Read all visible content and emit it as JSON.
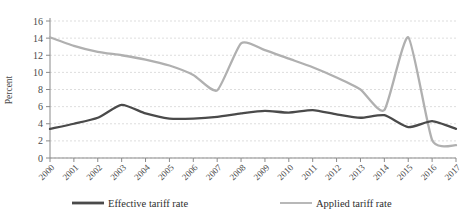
{
  "chart_data": {
    "type": "line",
    "title": "",
    "xlabel": "",
    "ylabel": "Percent",
    "ylim": [
      0,
      16
    ],
    "ytick_step": 2,
    "yticks": [
      "0",
      "2",
      "4",
      "6",
      "8",
      "10",
      "12",
      "14",
      "16"
    ],
    "grid": true,
    "legend_position": "bottom",
    "x": [
      "2000",
      "2001",
      "2002",
      "2003",
      "2004",
      "2005",
      "2006",
      "2007",
      "2008",
      "2009",
      "2010",
      "2011",
      "2012",
      "2013",
      "2014",
      "2015",
      "2016",
      "2017"
    ],
    "series": [
      {
        "name": "Effective tariff rate",
        "color": "#4a4a4a",
        "width": 2.3,
        "values": [
          3.4,
          4.0,
          4.7,
          6.2,
          5.2,
          4.6,
          4.6,
          4.8,
          5.2,
          5.5,
          5.3,
          5.6,
          5.1,
          4.7,
          5.0,
          3.6,
          4.3,
          3.4
        ]
      },
      {
        "name": "Applied tariff rate",
        "color": "#b0b0b0",
        "width": 2.3,
        "values": [
          14.1,
          13.1,
          12.4,
          12.0,
          11.5,
          10.8,
          9.7,
          7.9,
          13.4,
          12.6,
          11.6,
          10.6,
          9.4,
          8.0,
          5.6,
          14.1,
          2.1,
          1.5
        ]
      }
    ]
  },
  "legend": {
    "entries": [
      {
        "label": "Effective tariff rate"
      },
      {
        "label": "Applied tariff rate"
      }
    ]
  },
  "axes": {
    "y_title": "Percent"
  }
}
